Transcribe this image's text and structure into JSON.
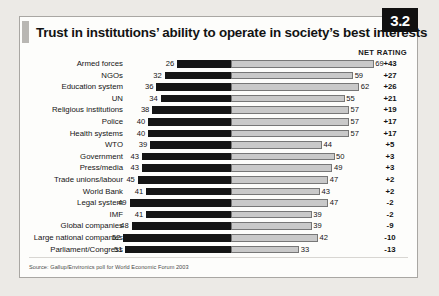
{
  "figure": {
    "badge": "3.2",
    "title": "Trust in institutions’ ability to operate in society’s best interests",
    "net_header": "NET RATING",
    "source": "Source: Gallup/Environics poll for World Economic Forum 2003"
  },
  "chart_data": {
    "type": "bar",
    "title": "Trust in institutions’ ability to operate in society’s best interests",
    "subtype": "diverging-horizontal",
    "xlabel": "",
    "ylabel": "",
    "grid": false,
    "legend": "none",
    "series": [
      {
        "name": "Distrust",
        "color": "#151515",
        "direction": "left"
      },
      {
        "name": "Trust",
        "color": "#c9c9c9",
        "direction": "right"
      }
    ],
    "value_columns": [
      "distrust",
      "trust",
      "net_rating"
    ],
    "categories": [
      "Armed forces",
      "NGOs",
      "Education system",
      "UN",
      "Religious institutions",
      "Police",
      "Health systems",
      "WTO",
      "Government",
      "Press/media",
      "Trade unions/labour",
      "World Bank",
      "Legal system",
      "IMF",
      "Global companies",
      "Large national companies",
      "Parliament/Congress"
    ],
    "rows": [
      {
        "label": "Armed forces",
        "distrust": 26,
        "trust": 69,
        "net": "+43"
      },
      {
        "label": "NGOs",
        "distrust": 32,
        "trust": 59,
        "net": "+27"
      },
      {
        "label": "Education system",
        "distrust": 36,
        "trust": 62,
        "net": "+26"
      },
      {
        "label": "UN",
        "distrust": 34,
        "trust": 55,
        "net": "+21"
      },
      {
        "label": "Religious institutions",
        "distrust": 38,
        "trust": 57,
        "net": "+19"
      },
      {
        "label": "Police",
        "distrust": 40,
        "trust": 57,
        "net": "+17"
      },
      {
        "label": "Health systems",
        "distrust": 40,
        "trust": 57,
        "net": "+17"
      },
      {
        "label": "WTO",
        "distrust": 39,
        "trust": 44,
        "net": "+5"
      },
      {
        "label": "Government",
        "distrust": 43,
        "trust": 50,
        "net": "+3"
      },
      {
        "label": "Press/media",
        "distrust": 43,
        "trust": 49,
        "net": "+3"
      },
      {
        "label": "Trade unions/labour",
        "distrust": 45,
        "trust": 47,
        "net": "+2"
      },
      {
        "label": "World Bank",
        "distrust": 41,
        "trust": 43,
        "net": "+2"
      },
      {
        "label": "Legal system",
        "distrust": 49,
        "trust": 47,
        "net": "-2"
      },
      {
        "label": "IMF",
        "distrust": 41,
        "trust": 39,
        "net": "-2"
      },
      {
        "label": "Global companies",
        "distrust": 48,
        "trust": 39,
        "net": "-9"
      },
      {
        "label": "Large national companies",
        "distrust": 52,
        "trust": 42,
        "net": "-10"
      },
      {
        "label": "Parliament/Congress",
        "distrust": 51,
        "trust": 33,
        "net": "-13"
      }
    ]
  }
}
